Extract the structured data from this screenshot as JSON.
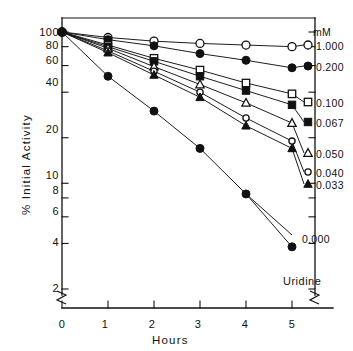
{
  "chart_data": {
    "type": "line",
    "title": "",
    "xlabel": "Hours",
    "ylabel": "% Initial Activity",
    "yscale": "log",
    "xlim": [
      0,
      5
    ],
    "ylim": [
      2,
      100
    ],
    "grid": false,
    "legend_position": "right",
    "legend_header": "mM",
    "annotation": "Uridine",
    "xticks": [
      0,
      1,
      2,
      3,
      4,
      5
    ],
    "xticklabels": [
      "0",
      "1",
      "2",
      "3",
      "4",
      "5"
    ],
    "yticks": [
      100,
      80,
      60,
      40,
      20,
      10,
      8,
      6,
      4,
      2
    ],
    "yticklabels": [
      "100",
      "80",
      "60",
      "40",
      "20",
      "10",
      "8",
      "6",
      "4",
      "2"
    ],
    "axis_break_left": true,
    "axis_break_right": true,
    "x": [
      0,
      1,
      2,
      3,
      4,
      5
    ],
    "series": [
      {
        "name": "1.000",
        "label": "1.000",
        "marker": "open-circle",
        "values": [
          100,
          92,
          87,
          84,
          82,
          80
        ]
      },
      {
        "name": "0.200",
        "label": "0.200",
        "marker": "filled-circle",
        "values": [
          100,
          89,
          81,
          72,
          65,
          58
        ]
      },
      {
        "name": "0.100",
        "label": "0.100",
        "marker": "open-square",
        "values": [
          100,
          82,
          67,
          56,
          46,
          39
        ]
      },
      {
        "name": "0.067",
        "label": "0.067",
        "marker": "filled-square",
        "values": [
          100,
          80,
          64,
          51,
          41,
          33
        ]
      },
      {
        "name": "0.050",
        "label": "0.050",
        "marker": "open-triangle",
        "values": [
          100,
          78,
          59,
          45,
          34,
          25
        ]
      },
      {
        "name": "0.040",
        "label": "0.040",
        "marker": "small-open-circle",
        "values": [
          100,
          75,
          55,
          40,
          27,
          19
        ]
      },
      {
        "name": "0.033",
        "label": "0.033",
        "marker": "filled-triangle",
        "values": [
          100,
          73,
          52,
          37,
          24,
          17
        ]
      },
      {
        "name": "0.000",
        "label": "0.000",
        "marker": "filled-circle",
        "values": [
          100,
          51,
          30,
          17,
          8.5,
          3.8
        ]
      }
    ]
  },
  "axes": {
    "ylabel": "% Initial Activity",
    "xlabel": "Hours"
  },
  "legend": {
    "header": "mM",
    "items": [
      {
        "label": "1.000",
        "marker": "open-circle"
      },
      {
        "label": "0.200",
        "marker": "filled-circle"
      },
      {
        "label": "0.100",
        "marker": "open-square"
      },
      {
        "label": "0.067",
        "marker": "filled-square"
      },
      {
        "label": "0.050",
        "marker": "open-triangle"
      },
      {
        "label": "0.040",
        "marker": "small-open-circle"
      },
      {
        "label": "0.033",
        "marker": "filled-triangle"
      },
      {
        "label": "0.000",
        "marker": "filled-circle"
      }
    ]
  },
  "annotations": {
    "compound": "Uridine"
  },
  "yticklabels": {
    "t0": "100",
    "t1": "80",
    "t2": "60",
    "t3": "40",
    "t4": "20",
    "t5": "10",
    "t6": "8",
    "t7": "6",
    "t8": "4",
    "t9": "2"
  },
  "xticklabels": {
    "t0": "0",
    "t1": "1",
    "t2": "2",
    "t3": "3",
    "t4": "4",
    "t5": "5"
  },
  "colors": {
    "ink": "#111111",
    "background": "#ffffff"
  }
}
